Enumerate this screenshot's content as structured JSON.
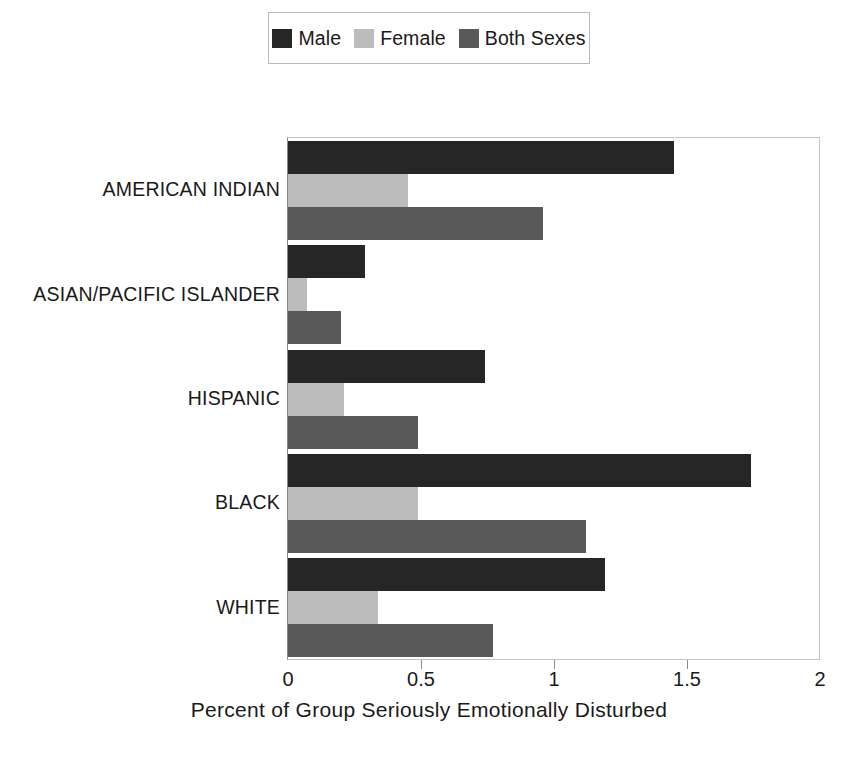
{
  "chart_data": {
    "type": "bar",
    "orientation": "horizontal",
    "title": "",
    "xlabel": "Percent of Group Seriously Emotionally Disturbed",
    "ylabel": "",
    "xlim": [
      0,
      2
    ],
    "xticks": [
      "0",
      "0.5",
      "1",
      "1.5",
      "2"
    ],
    "xtick_values": [
      0,
      0.5,
      1,
      1.5,
      2
    ],
    "grid": false,
    "legend_position": "top-center",
    "categories": [
      "AMERICAN INDIAN",
      "ASIAN/PACIFIC ISLANDER",
      "HISPANIC",
      "BLACK",
      "WHITE"
    ],
    "series": [
      {
        "name": "Male",
        "color": "#262626",
        "values": [
          1.45,
          0.29,
          0.74,
          1.74,
          1.19
        ]
      },
      {
        "name": "Female",
        "color": "#bcbcbc",
        "values": [
          0.45,
          0.07,
          0.21,
          0.49,
          0.34
        ]
      },
      {
        "name": "Both Sexes",
        "color": "#595959",
        "values": [
          0.96,
          0.2,
          0.49,
          1.12,
          0.77
        ]
      }
    ]
  },
  "legend": {
    "entries": [
      {
        "label": "Male",
        "swatch": "legend-swatch-male"
      },
      {
        "label": "Female",
        "swatch": "legend-swatch-female"
      },
      {
        "label": "Both Sexes",
        "swatch": "legend-swatch-both-sexes"
      }
    ]
  },
  "axis": {
    "x_title": "Percent of Group Seriously Emotionally Disturbed",
    "x_tick_labels": [
      "0",
      "0.5",
      "1",
      "1.5",
      "2"
    ]
  },
  "categories": [
    "AMERICAN INDIAN",
    "ASIAN/PACIFIC ISLANDER",
    "HISPANIC",
    "BLACK",
    "WHITE"
  ]
}
